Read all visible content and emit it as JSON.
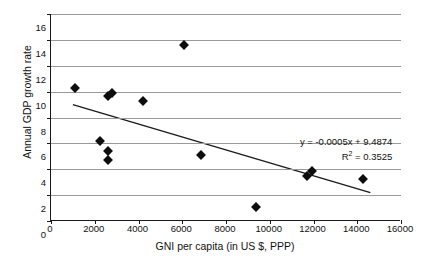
{
  "chart_data": {
    "type": "scatter",
    "title": "",
    "xlabel": "GNI per capita (in US $, PPP)",
    "ylabel": "Annual GDP growth rate",
    "xlim": [
      0,
      16000
    ],
    "ylim": [
      0,
      16
    ],
    "xticks": [
      0,
      2000,
      4000,
      6000,
      8000,
      10000,
      12000,
      14000,
      16000
    ],
    "yticks": [
      0,
      2,
      4,
      6,
      8,
      10,
      12,
      14,
      16
    ],
    "grid": "horizontal",
    "legend": "none",
    "marker_style": "filled-diamond",
    "marker_color": "#0d0d0d",
    "series": [
      {
        "name": "countries",
        "points": [
          {
            "x": 1100,
            "y": 10.3
          },
          {
            "x": 2250,
            "y": 6.15
          },
          {
            "x": 2600,
            "y": 5.4
          },
          {
            "x": 2600,
            "y": 4.75
          },
          {
            "x": 2620,
            "y": 9.7
          },
          {
            "x": 2800,
            "y": 9.9
          },
          {
            "x": 4200,
            "y": 9.3
          },
          {
            "x": 6100,
            "y": 13.6
          },
          {
            "x": 6850,
            "y": 5.1
          },
          {
            "x": 9350,
            "y": 1.1
          },
          {
            "x": 11700,
            "y": 3.45
          },
          {
            "x": 11950,
            "y": 3.85
          },
          {
            "x": 14250,
            "y": 3.25
          }
        ]
      }
    ],
    "trendline": {
      "type": "linear",
      "slope": -0.0005,
      "intercept": 9.4874,
      "r_squared": 0.3525,
      "x_start": 1000,
      "x_end": 14600,
      "equation_label": "y = -0.0005x + 9.4874",
      "r_squared_label": "R2 = 0.3525",
      "r_squared_prefix": "R",
      "r_squared_exponent": "2",
      "r_squared_suffix": " = 0.3525"
    }
  }
}
